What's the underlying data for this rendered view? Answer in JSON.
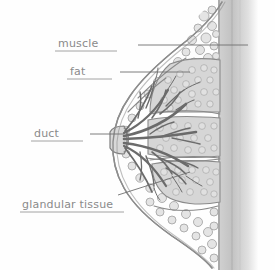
{
  "figure": {
    "kind": "hand-drawn anatomical cross-section",
    "medium": "pencil sketch on white paper",
    "background_color": "#fefefe",
    "ink_color": "#8a8a8a",
    "leader_color": "#6f6f6f",
    "tissue_fill": "#d6d6d6",
    "fat_fill": "#e4e4e4",
    "muscle_fill": "#c9c9c9"
  },
  "labels": [
    {
      "id": "muscle",
      "text": "muscle",
      "text_x": 58,
      "text_y": 47,
      "underline_x1": 55,
      "underline_x2": 117,
      "underline_y": 51,
      "leader_x1": 138,
      "leader_y1": 45,
      "leader_x2": 248,
      "leader_y2": 45,
      "target": "pectoral muscle / chest wall"
    },
    {
      "id": "fat",
      "text": "fat",
      "text_x": 70,
      "text_y": 75,
      "underline_x1": 67,
      "underline_x2": 112,
      "underline_y": 79,
      "leader_x1": 120,
      "leader_y1": 72,
      "leader_x2": 190,
      "leader_y2": 72,
      "target": "subcutaneous fat layer"
    },
    {
      "id": "duct",
      "text": "duct",
      "text_x": 34,
      "text_y": 137,
      "underline_x1": 31,
      "underline_x2": 83,
      "underline_y": 141,
      "leader_x1": 90,
      "leader_y1": 134,
      "leader_x2": 124,
      "leader_y2": 134,
      "target": "lactiferous duct at nipple"
    },
    {
      "id": "glandular-tissue",
      "text": "glandular tissue",
      "text_x": 22,
      "text_y": 208,
      "underline_x1": 20,
      "underline_x2": 124,
      "underline_y": 212,
      "leader_x1": 118,
      "leader_y1": 195,
      "leader_x2": 190,
      "leader_y2": 172,
      "target": "lower glandular lobe"
    }
  ]
}
